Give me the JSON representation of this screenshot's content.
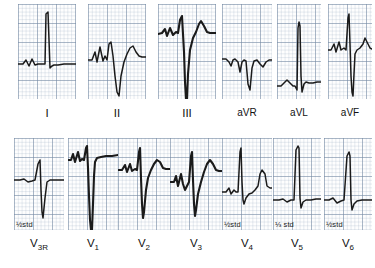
{
  "figure": {
    "type": "12-lead-ecg",
    "title": "",
    "grid_color": "#7e90a8",
    "trace_color": "#1a1a1a",
    "background": "#ffffff",
    "rows": 2,
    "columns": 6
  },
  "rows": [
    {
      "name": "limb-leads",
      "leads": [
        {
          "id": "I",
          "label": "I",
          "subscript": "",
          "calibration": "",
          "x": 18,
          "panel_w": 58,
          "panel_h": 95,
          "path": "M0,60 L5,60 L8,56 L11,62 L14,55 L17,61 L20,60 L24,60 L27,60 L28,10 L30,8 L32,64 L34,62 L36,61 L40,61 L46,60 L52,60 L58,60",
          "description": "small notched P, tall narrow R spike, flat baseline"
        },
        {
          "id": "II",
          "label": "II",
          "subscript": "",
          "calibration": "",
          "x": 88,
          "panel_w": 58,
          "panel_h": 95,
          "path": "M0,56 L4,56 L7,48 L9,58 L12,43 L15,57 L17,52 L19,56 L21,40 L23,38 L25,52 L27,72 L29,88 L31,92 L33,72 L36,58 L39,50 L42,44 L45,42 L48,48 L51,52 L54,53 L58,53",
          "description": "notched P and R, deep S wave, rounded T wave"
        },
        {
          "id": "III",
          "label": "III",
          "subscript": "",
          "calibration": "",
          "x": 158,
          "panel_w": 58,
          "panel_h": 95,
          "path": "M0,30 L4,29 L7,25 L9,32 L12,24 L15,31 L18,28 L20,29 L22,16 L24,12 L26,48 L27,78 L28,95 L29,95 L30,70 L32,46 L35,34 L38,28 L41,20 L43,17 L46,22 L49,28 L52,29 L58,29",
          "description": "very deep S descending off panel, T wave after"
        }
      ]
    },
    {
      "name": "augmented-limb-leads",
      "leads": [
        {
          "id": "aVR",
          "label": "aVR",
          "subscript": "",
          "calibration": "",
          "x": 222,
          "panel_w": 50,
          "panel_h": 95,
          "path": "M0,55 L4,55 L7,58 L9,62 L11,56 L13,55 L16,58 L18,68 L20,58 L22,56 L24,57 L26,80 L28,86 L30,64 L32,57 L35,56 L38,60 L41,63 L44,58 L47,56 L50,56",
          "description": "all negative: inverted P, deep QS, inverted T"
        },
        {
          "id": "aVL",
          "label": "aVL",
          "subscript": "",
          "calibration": "",
          "x": 277,
          "panel_w": 44,
          "panel_h": 95,
          "path": "M0,82 L4,82 L7,79 L10,76 L13,79 L16,82 L18,82 L20,86 L21,24 L22,18 L23,22 L24,72 L25,88 L27,80 L29,78 L32,79 L36,79 L40,78 L44,78",
          "description": "low P, very tall narrow R spike, small S"
        },
        {
          "id": "aVF",
          "label": "aVF",
          "subscript": "",
          "calibration": "",
          "x": 328,
          "panel_w": 44,
          "panel_h": 95,
          "path": "M0,46 L3,46 L6,40 L8,48 L11,38 L13,46 L16,44 L18,46 L20,14 L21,10 L22,40 L23,72 L24,88 L25,92 L26,70 L27,50 L29,46 L32,44 L35,40 L37,34 L39,38 L42,44 L44,45",
          "description": "tall R spike then deep S, T wave"
        }
      ]
    },
    {
      "name": "right-and-precordial-leads-1",
      "leads": [
        {
          "id": "V3R",
          "label": "V",
          "subscript": "3R",
          "calibration": "½std",
          "x": 14,
          "panel_w": 50,
          "panel_h": 92,
          "path": "M0,42 L6,42 L10,41 L14,44 L18,43 L21,42 L24,26 L26,22 L27,52 L28,74 L29,80 L31,60 L33,44 L36,42 L40,42 L45,42 L50,42",
          "description": "small r then deep QS wave, flat baseline"
        },
        {
          "id": "V1",
          "label": "V",
          "subscript": "1",
          "calibration": "",
          "x": 68,
          "panel_w": 50,
          "panel_h": 92,
          "path": "M0,22 L3,22 L5,16 L7,24 L10,14 L12,23 L14,21 L16,22 L18,10 L19,8 L20,30 L21,58 L22,82 L23,92 L24,92 L25,66 L26,38 L27,24 L29,20 L33,19 L38,18 L44,18 L50,17",
          "description": "complex near top with very deep S to panel bottom"
        },
        {
          "id": "V2",
          "label": "V",
          "subscript": "2",
          "calibration": "",
          "x": 118,
          "panel_w": 52,
          "panel_h": 92,
          "path": "M0,32 L4,32 L7,27 L9,34 L12,26 L14,33 L17,31 L19,32 L21,14 L22,10 L23,40 L24,66 L25,80 L26,74 L28,52 L30,40 L33,32 L36,26 L39,22 L42,24 L45,30 L48,31 L52,31",
          "description": "tall R then deep S, rounded T wave"
        }
      ]
    },
    {
      "name": "precordial-leads-2",
      "leads": [
        {
          "id": "V3",
          "label": "V",
          "subscript": "3",
          "calibration": "",
          "x": 170,
          "panel_w": 52,
          "panel_h": 92,
          "path": "M0,44 L4,44 L6,38 L8,48 L11,36 L13,46 L15,52 L17,48 L19,44 L21,18 L22,14 L23,42 L24,66 L25,78 L26,72 L28,56 L31,44 L34,34 L37,26 L40,22 L43,26 L46,32 L49,33 L52,33",
          "description": "R spike, deep S, rising into T wave"
        },
        {
          "id": "V4",
          "label": "V",
          "subscript": "4",
          "calibration": "½std",
          "x": 222,
          "panel_w": 50,
          "panel_h": 92,
          "path": "M0,54 L4,54 L7,50 L9,56 L12,52 L14,54 L16,54 L18,14 L19,10 L20,44 L21,62 L22,66 L24,60 L27,56 L30,55 L33,52 L36,48 L38,36 L40,32 L43,36 L45,48 L48,50 L50,50",
          "description": "tall R spike, small S, elevated T wave"
        },
        {
          "id": "V5",
          "label": "V",
          "subscript": "5",
          "calibration": "⅓ std",
          "x": 273,
          "panel_w": 48,
          "panel_h": 92,
          "path": "M0,62 L6,62 L10,61 L14,64 L18,62 L21,62 L23,12 L25,8 L26,10 L27,60 L28,70 L30,64 L33,62 L38,62 L43,61 L48,61",
          "description": "very tall narrow R spike on flat baseline"
        },
        {
          "id": "V6",
          "label": "V",
          "subscript": "6",
          "calibration": "½std",
          "x": 324,
          "panel_w": 48,
          "panel_h": 92,
          "path": "M0,62 L5,62 L9,60 L13,65 L17,63 L20,62 L23,18 L25,14 L26,18 L27,62 L28,72 L30,66 L33,63 L38,62 L43,62 L48,62",
          "description": "tall narrow R spike, flat baseline"
        }
      ]
    }
  ]
}
